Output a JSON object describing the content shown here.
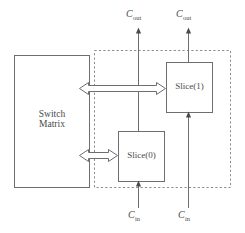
{
  "diagram": {
    "colors": {
      "stroke": "#6e6e6e",
      "dashed_stroke": "#8c8c8c",
      "text": "#4a4a4a",
      "background": "#ffffff"
    },
    "blocks": {
      "switch_matrix": {
        "label_line1": "Switch",
        "label_line2": "Matrix"
      },
      "slice1": {
        "label": "Slice(1)"
      },
      "slice0": {
        "label": "Slice(0)"
      }
    },
    "signals": {
      "carry_out_left": {
        "symbol": "C",
        "subscript": "out"
      },
      "carry_out_right": {
        "symbol": "C",
        "subscript": "out"
      },
      "carry_in_left": {
        "symbol": "C",
        "subscript": "in"
      },
      "carry_in_right": {
        "symbol": "C",
        "subscript": "in"
      }
    },
    "connectors": {
      "slice1_bus_label": "",
      "slice0_bus_label": ""
    }
  }
}
